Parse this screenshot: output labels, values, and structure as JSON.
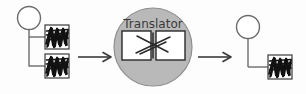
{
  "diagram": {
    "background_color": "#fdfdfd",
    "stroke_color": "#6b6b6b",
    "dark_stroke_color": "#2a2a2a",
    "translator_fill": "#b9b9b9",
    "node_fill": "#ffffff",
    "scribble_color": "#121212",
    "translator": {
      "label": "Translator",
      "label_color": "#3a3a3a",
      "shape": "circle",
      "inner_boxes": 2,
      "inner_connector": "crossing-lines"
    },
    "input_group": {
      "name": "source-tree",
      "root": "circle-node",
      "leaves": 2,
      "leaf_type": "scribble-box"
    },
    "output_group": {
      "name": "target-tree",
      "root": "circle-node",
      "leaves": 1,
      "leaf_type": "scribble-box"
    },
    "arrows": [
      {
        "name": "arrow-input-to-translator",
        "direction": "right"
      },
      {
        "name": "arrow-translator-to-output",
        "direction": "right"
      }
    ]
  }
}
